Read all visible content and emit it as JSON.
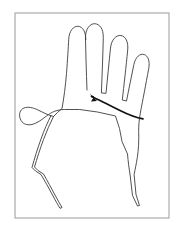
{
  "figure": {
    "kind": "line-drawing",
    "background_color": "#ffffff",
    "canvas": {
      "width": 179,
      "height": 230
    }
  },
  "frame": {
    "name": "figure-border",
    "stroke_color": "#9a9a9a",
    "stroke_width": 1,
    "fill_color": "#ffffff",
    "x": 15,
    "y": 13,
    "width": 154,
    "height": 205
  },
  "hand": {
    "label": "left-hand-palm-outline",
    "stroke_color": "#3d3d3d",
    "stroke_width": 0.9,
    "orientation": "palm-facing-viewer",
    "fingers": [
      {
        "name": "thumb",
        "tip_x": 28,
        "tip_y": 113
      },
      {
        "name": "index-finger",
        "tip_x": 75,
        "tip_y": 33
      },
      {
        "name": "middle-finger",
        "tip_x": 99,
        "tip_y": 27
      },
      {
        "name": "ring-finger",
        "tip_x": 121,
        "tip_y": 37
      },
      {
        "name": "little-finger",
        "tip_x": 142,
        "tip_y": 58
      }
    ],
    "path": "M 95.5 92.5 C 94.8 74 94.3 56 94.0 40.5 C 93.8 31.5 98.5 26.0 103.2 26.2 C 108.0 26.4 112.0 31.2 111.8 40.0 C 111.4 58.0 110.6 77.0 109.9 95.5 L 114.5 95.8 C 115.9 82.0 117.6 64.0 119.0 50.5 C 119.9 42.0 124.8 37.3 129.4 38.0 C 134.0 38.7 137.0 44.2 136.2 52.5 C 134.6 69.0 132.4 88.0 130.8 102.5 L 135.0 103.5 C 137.3 92.0 140.2 77.5 142.4 67.0 C 144.0 59.3 148.6 55.8 152.6 57.0 C 156.6 58.2 158.6 63.6 157.2 71.2 C 154.5 86.0 151.0 104.0 149.0 114.5 C 147.6 122.0 147.0 129.0 147.2 135.0 C 147.5 143.5 147.0 152.0 145.8 160.0 C 144.8 166.5 143.6 172.0 142.6 177.0 L 144.5 197.0 L 148.0 208.0 L 146.0 208.5 L 141.0 198.0 L 138.6 177.5 C 137.6 171.0 136.6 164.0 136.0 156.5 L 130.5 144.0 L 128.0 131.0 L 124.0 118.5 L 106.0 114.5 L 88.0 112.0 L 73.0 112.0 C 66.0 112.0 60.0 114.5 55.0 118.5 C 50.0 122.5 45.0 126.0 40.5 127.0 C 35.0 128.2 30.5 126.0 28.8 121.5 C 27.0 116.8 28.5 112.0 32.5 110.5 C 36.5 109.0 41.5 110.0 46.5 112.5 C 52.0 115.2 57.5 118.0 62.0 119.0 L 66.0 115.0 L 70.5 111.0 C 72.5 100.0 74.0 88.0 75.0 76.0 C 76.0 63.0 76.8 50.0 77.2 42.0 C 77.6 33.2 82.0 28.5 86.6 28.8 C 91.2 29.1 94.4 34.2 94.2 42.5 L 94.0 40.5 M 62.0 119.0 C 58.5 126.0 55.0 134.0 52.0 142.0 C 48.5 151.5 45.5 161.0 43.0 169.5 L 46.5 173.0 L 52.0 176.5 C 56.0 183.5 60.0 191.0 63.5 197.5 C 66.5 203.0 69.0 207.5 70.5 210.0 L 68.5 210.8 C 66.8 208.0 64.0 203.2 61.0 197.5 C 57.5 191.0 53.5 183.5 49.5 177.0 L 44.0 173.5 L 40.5 170.0 C 43.0 161.0 46.0 151.0 49.5 141.5 C 52.5 133.0 56.0 125.0 59.5 118.0",
    "path_scale": "figure-space",
    "path_transform": "translate(-8.5,-2.5) scale(1.0)"
  },
  "annotation": {
    "label": "palm-crease-callout",
    "description": "bold curved line with arrowhead marking the upper palm crease",
    "stroke_color": "#111111",
    "stroke_width": 1.7,
    "arrow_tip_x": 90,
    "arrow_tip_y": 95,
    "arrow_direction": "up-left",
    "end_x": 143,
    "end_y": 118,
    "path": "M 91.5 96.5 C 99.0 100.0 110.0 105.5 120.0 110.5 C 130.0 115.5 138.0 118.0 143.0 118.8",
    "arrow_polygon": "89.4,94.0 97.0,101.0 91.0,101.6 94.2,96.4"
  },
  "caption": {
    "text": ""
  }
}
